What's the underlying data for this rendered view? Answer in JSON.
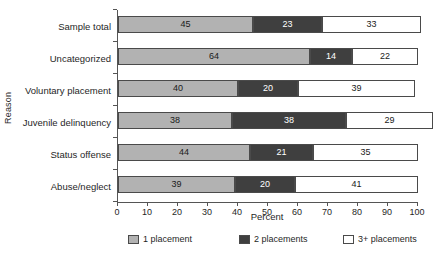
{
  "chart_data": {
    "type": "bar",
    "orientation": "horizontal",
    "stacked": true,
    "title": "",
    "xlabel": "Percent",
    "ylabel": "Reason",
    "xlim": [
      0,
      100
    ],
    "xticks": [
      0,
      10,
      20,
      30,
      40,
      50,
      60,
      70,
      80,
      90,
      100
    ],
    "xtick_labels": [
      "0",
      "10",
      "20",
      "30",
      "40",
      "50",
      "60",
      "70",
      "80",
      "90",
      "100"
    ],
    "grid": false,
    "legend_position": "bottom",
    "categories": [
      "Sample total",
      "Uncategorized",
      "Voluntary placement",
      "Juvenile delinquency",
      "Status offense",
      "Abuse/neglect"
    ],
    "series": [
      {
        "name": "1 placement",
        "color": "#b2b2b2",
        "values": [
          45,
          64,
          40,
          38,
          44,
          39
        ],
        "labels": [
          "45",
          "64",
          "40",
          "38",
          "44",
          "39"
        ]
      },
      {
        "name": "2 placements",
        "color": "#3f3f3f",
        "values": [
          23,
          14,
          20,
          38,
          21,
          20
        ],
        "labels": [
          "23",
          "14",
          "20",
          "38",
          "21",
          "20"
        ]
      },
      {
        "name": "3+ placements",
        "color": "#ffffff",
        "values": [
          33,
          22,
          39,
          29,
          35,
          41
        ],
        "labels": [
          "33",
          "22",
          "39",
          "29",
          "35",
          "41"
        ]
      }
    ],
    "legend": [
      "1 placement",
      "2 placements",
      "3+ placements"
    ]
  }
}
